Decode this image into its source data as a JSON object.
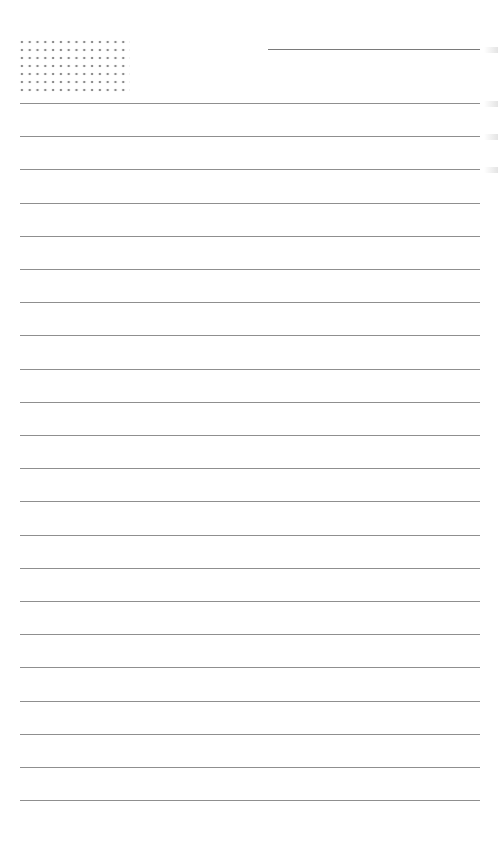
{
  "page": {
    "type": "lined-notepaper",
    "background": "#ffffff",
    "rule_color": "#8f8f8f",
    "dot_color": "#8c8c8c"
  },
  "header": {
    "dot_grid": {
      "columns": 14,
      "rows": 7
    },
    "title_line": {
      "label": ""
    }
  },
  "rules": {
    "count": 22,
    "first_y": 103,
    "spacing": 33.2
  }
}
